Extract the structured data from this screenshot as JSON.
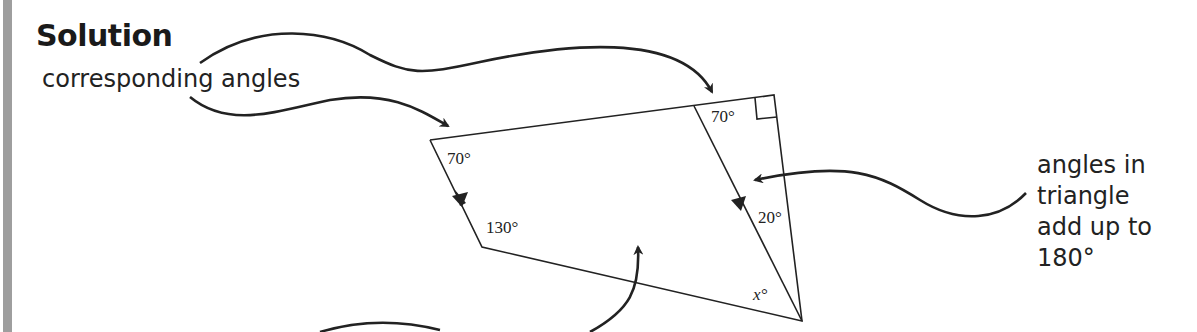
{
  "heading": "Solution",
  "annotations": {
    "corresponding": "corresponding angles",
    "triangle_line1": "angles in",
    "triangle_line2": "triangle",
    "triangle_line3": "add up to",
    "triangle_line4": "180°"
  },
  "angles": {
    "top_left": "70°",
    "bottom_left": "130°",
    "top_inner": "70°",
    "right_inner": "20°",
    "bottom_right": "x°"
  },
  "colors": {
    "line": "#222222",
    "side_bar": "#9e9e9e"
  }
}
